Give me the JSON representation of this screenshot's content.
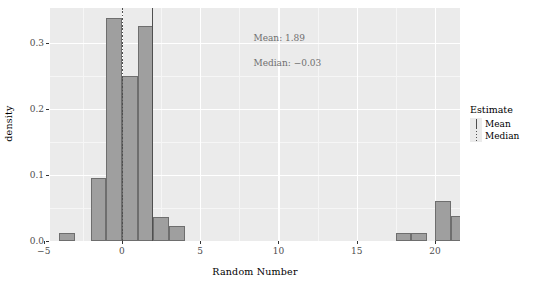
{
  "chart_data": {
    "type": "bar",
    "title": "",
    "subtitle": "",
    "xlabel": "Random Number",
    "ylabel": "density",
    "xlim": [
      -4.6,
      21.6
    ],
    "ylim": [
      0.0,
      0.3525
    ],
    "grid": true,
    "x_ticks": [
      -5,
      0,
      5,
      10,
      15,
      20
    ],
    "x_tick_labels": [
      "−5",
      "0",
      "5",
      "10",
      "15",
      "20"
    ],
    "x_minor_ticks": [
      -2.5,
      2.5,
      7.5,
      12.5,
      17.5
    ],
    "y_ticks": [
      0.0,
      0.1,
      0.2,
      0.3
    ],
    "y_tick_labels": [
      "0.0",
      "0.1",
      "0.2",
      "0.3"
    ],
    "y_minor_ticks": [
      0.05,
      0.15,
      0.25
    ],
    "bin_width": 1,
    "bins": [
      {
        "x0": -4,
        "x1": -3,
        "value": 0.012
      },
      {
        "x0": -2,
        "x1": -1,
        "value": 0.096
      },
      {
        "x0": -1,
        "x1": 0,
        "value": 0.337
      },
      {
        "x0": 0,
        "x1": 1,
        "value": 0.249
      },
      {
        "x0": 1,
        "x1": 2,
        "value": 0.326
      },
      {
        "x0": 2,
        "x1": 3,
        "value": 0.037
      },
      {
        "x0": 3,
        "x1": 4,
        "value": 0.022
      },
      {
        "x0": 17.5,
        "x1": 18.5,
        "value": 0.012
      },
      {
        "x0": 18.5,
        "x1": 19.5,
        "value": 0.012
      },
      {
        "x0": 20,
        "x1": 21,
        "value": 0.06
      },
      {
        "x0": 21,
        "x1": 22,
        "value": 0.038
      }
    ],
    "reference_lines": [
      {
        "name": "Mean",
        "value": 1.89,
        "style": "solid"
      },
      {
        "name": "Median",
        "value": -0.03,
        "style": "dotted"
      }
    ],
    "annotations": [
      {
        "text": "Mean: 1.89",
        "x": 8.4,
        "y": 0.305
      },
      {
        "text": "Median: −0.03",
        "x": 8.4,
        "y": 0.268
      }
    ],
    "legend": {
      "title": "Estimate",
      "position": "right",
      "entries": [
        {
          "label": "Mean",
          "style": "solid"
        },
        {
          "label": "Median",
          "style": "dotted"
        }
      ]
    },
    "colors": {
      "panel_background": "#EBEBEB",
      "gridline_major": "#FFFFFF",
      "gridline_minor": "#F6F6F6",
      "bar_fill": "#9F9F9F",
      "bar_outline": "#6E6E6E",
      "reference_line": "#4F4F4F",
      "annotation_text": "#6F6F6F",
      "tick_label": "#4D4D4D",
      "axis_title": "#000000",
      "plot_background": "#FFFFFF"
    }
  }
}
